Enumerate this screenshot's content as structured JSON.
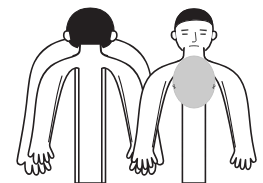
{
  "illustration": {
    "title": "Human body outline — posterior and anterior views",
    "background_color": "#ffffff",
    "stroke_color": "#231f20",
    "hair_color": "#231f20",
    "skin_fill": "#ffffff",
    "shaded_region_color": "#cbcbcb",
    "shaded_region_stroke": "#c2c2c2"
  },
  "figures": [
    {
      "id": "posterior-figure",
      "label": "Back view figure",
      "orientation": "posterior",
      "position": "left",
      "head": {
        "label": "Back of head",
        "hair_visible": true,
        "face_visible": false,
        "ears_visible": true
      },
      "markings": [],
      "marked_regions": []
    },
    {
      "id": "anterior-figure",
      "label": "Front view figure",
      "orientation": "anterior",
      "position": "right",
      "head": {
        "label": "Front of head",
        "hair_visible": true,
        "face_visible": true,
        "ears_visible": true,
        "features": [
          "eyebrows",
          "eyes",
          "nose",
          "mouth",
          "chin"
        ]
      },
      "markings": [
        "left-nipple",
        "right-nipple",
        "sternal-notch"
      ],
      "marked_regions": [
        {
          "id": "chest-shaded-oval",
          "label": "Central chest / sternum shaded area",
          "shape": "oval",
          "fill": "#cbcbcb",
          "center_x": 194,
          "center_y": 82,
          "radius_x": 21,
          "radius_y": 26
        }
      ]
    }
  ],
  "icon_names": {
    "body_outline": "body-outline-icon",
    "shaded_area": "shaded-region-icon"
  }
}
